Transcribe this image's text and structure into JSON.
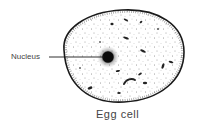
{
  "diagram": {
    "title": "Egg cell",
    "labels": {
      "nucleus": "Nucleus"
    },
    "caption": "Egg cell",
    "colors": {
      "outline": "#1a1a1a",
      "text": "#444444",
      "background": "#ffffff"
    }
  }
}
